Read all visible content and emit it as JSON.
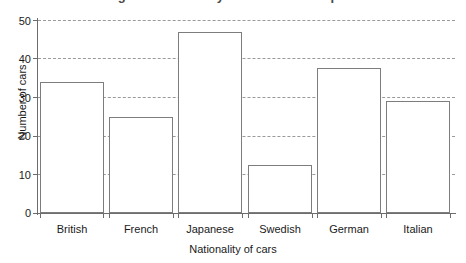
{
  "clipped_title": "Bar chart showing the nationality of cars in a car park",
  "chart_data": {
    "type": "bar",
    "title": "",
    "xlabel": "Nationality of cars",
    "ylabel": "Number of cars",
    "categories": [
      "British",
      "French",
      "Japanese",
      "Swedish",
      "German",
      "Italian"
    ],
    "values": [
      34,
      25,
      47,
      12.5,
      37.5,
      29
    ],
    "ylim": [
      0,
      50
    ],
    "yticks": [
      0,
      10,
      20,
      30,
      40,
      50
    ],
    "ytick_labels": [
      "0",
      "10",
      "20",
      "30",
      "40",
      "50"
    ],
    "grid": true,
    "grid_axis": "y",
    "grid_style": "dashed",
    "legend": false,
    "bar_fill": "#ffffff",
    "bar_edge": "#7d7d7d",
    "grid_color": "#9a9a9a",
    "axis_color": "#6d6d6d",
    "text_color": "#1a1a1a"
  }
}
